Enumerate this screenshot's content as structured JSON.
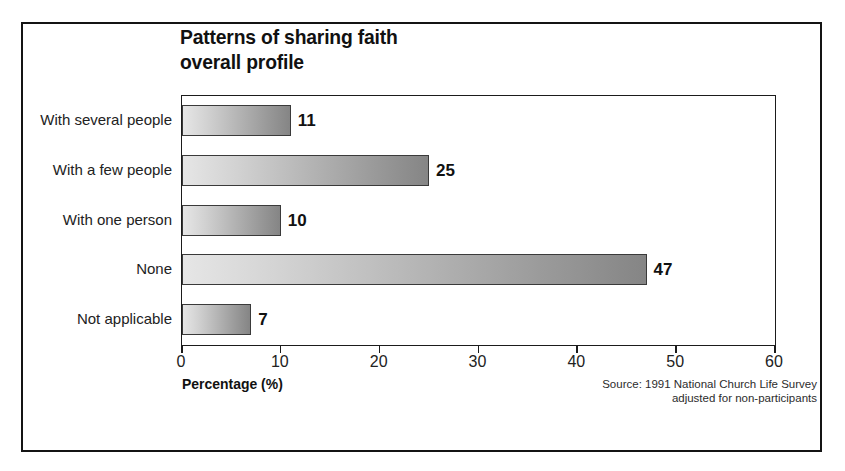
{
  "chart_data": {
    "type": "bar",
    "orientation": "horizontal",
    "title": "Patterns of sharing faith\noverall profile",
    "categories": [
      "With several people",
      "With a few people",
      "With one person",
      "None",
      "Not applicable"
    ],
    "values": [
      11,
      25,
      10,
      47,
      7
    ],
    "value_labels": [
      "11",
      "25",
      "10",
      "47",
      "7"
    ],
    "xlabel": "Percentage (%)",
    "ylabel": "",
    "xlim": [
      0,
      60
    ],
    "xticks": [
      0,
      10,
      20,
      30,
      40,
      50,
      60
    ],
    "xtick_labels": [
      "0",
      "10",
      "20",
      "30",
      "40",
      "50",
      "60"
    ],
    "grid": false,
    "legend": null,
    "annotations": [
      "Source: 1991 National Church Life Survey",
      "adjusted for non-participants"
    ],
    "bar_fill": {
      "start_color": "#e6e6e6",
      "end_color": "#858585",
      "border_color": "#3a3a3a"
    }
  },
  "source_note": "Source: 1991 National Church Life Survey\nadjusted for non-participants",
  "colors": {
    "frame": "#141414",
    "axis": "#1b1b1b",
    "text": "#1a1a1a"
  }
}
